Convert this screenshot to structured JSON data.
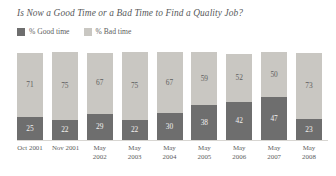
{
  "chart_data": {
    "type": "bar",
    "subtype": "stacked-100-percent-vertical",
    "title": "Is Now a Good Time or a Bad Time to Find a Quality Job?",
    "xlabel": "",
    "ylabel": "",
    "ylim": [
      0,
      100
    ],
    "grid": false,
    "legend_position": "top-left",
    "categories": [
      "Oct 2001",
      "Nov 2001",
      "May 2002",
      "May 2003",
      "May 2004",
      "May 2005",
      "May 2006",
      "May 2007",
      "May 2008"
    ],
    "category_lines": [
      [
        "Oct 2001"
      ],
      [
        "Nov 2001"
      ],
      [
        "May",
        "2002"
      ],
      [
        "May",
        "2003"
      ],
      [
        "May",
        "2004"
      ],
      [
        "May",
        "2005"
      ],
      [
        "May",
        "2006"
      ],
      [
        "May",
        "2007"
      ],
      [
        "May",
        "2008"
      ]
    ],
    "series": [
      {
        "name": "% Good time",
        "color": "#6e6e6e",
        "values": [
          25,
          22,
          29,
          22,
          30,
          38,
          42,
          47,
          23
        ]
      },
      {
        "name": "% Bad time",
        "color": "#c9c7c2",
        "values": [
          71,
          75,
          67,
          75,
          67,
          59,
          52,
          50,
          73
        ]
      }
    ],
    "stack_order_bottom_to_top": [
      "% Good time",
      "% Bad time"
    ]
  },
  "legend": {
    "items": [
      {
        "label": "% Good time",
        "color": "#6e6e6e",
        "swatch_icon": "square-swatch-icon"
      },
      {
        "label": "% Bad time",
        "color": "#c9c7c2",
        "swatch_icon": "square-swatch-icon"
      }
    ]
  },
  "colors": {
    "good_time": "#6e6e6e",
    "bad_time": "#c9c7c2",
    "text": "#5d5e60",
    "title_text": "#58595b",
    "baseline": "#d8d6d2",
    "background": "#ffffff"
  }
}
